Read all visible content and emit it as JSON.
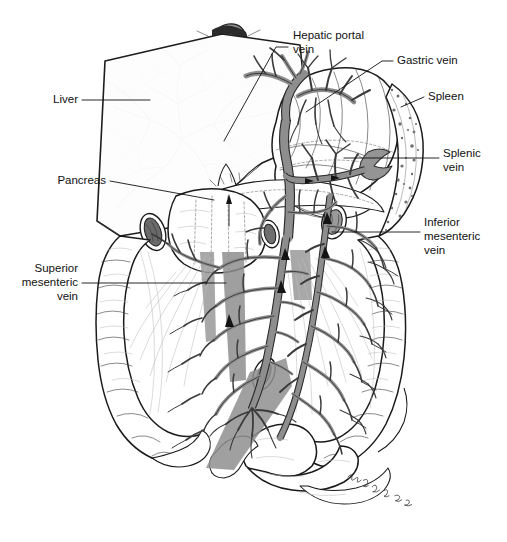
{
  "figure": {
    "kind": "anatomical-illustration",
    "background_color": "#ffffff",
    "line_color": "#111111",
    "vein_color": "#8e8e8e",
    "vein_outline_color": "#2e2e2e",
    "liver_vessel_color": "#bdbdbd",
    "spleen_stipple_color": "#6f6f6f",
    "label_font_size_px": 11.5
  },
  "labels": [
    {
      "id": "hepatic-portal-vein",
      "lines": [
        "Hepatic portal",
        "vein"
      ],
      "line1": "Hepatic portal",
      "line2": "vein",
      "text_x": 293,
      "text_y": 36,
      "align": "start",
      "leader": "M 288 47 L 276 47 L 224 141"
    },
    {
      "id": "gastric-vein",
      "lines": [
        "Gastric vein"
      ],
      "line1": "Gastric vein",
      "text_x": 397,
      "text_y": 61,
      "align": "start",
      "leader": "M 393 61 L 382 61 L 306 112"
    },
    {
      "id": "spleen",
      "lines": [
        "Spleen"
      ],
      "line1": "Spleen",
      "text_x": 428,
      "text_y": 97,
      "align": "start",
      "leader": "M 424 97 L 401 107"
    },
    {
      "id": "splenic-vein",
      "lines": [
        "Splenic",
        "vein"
      ],
      "line1": "Splenic",
      "line2": "vein",
      "text_x": 443,
      "text_y": 154,
      "align": "start",
      "leader": "M 439 158 L 344 158"
    },
    {
      "id": "inferior-mesenteric-vein",
      "lines": [
        "Inferior",
        "mesenteric",
        "vein"
      ],
      "line1": "Inferior",
      "line2": "mesenteric",
      "line3": "vein",
      "text_x": 424,
      "text_y": 223,
      "align": "start",
      "leader": "M 420 232 L 332 232"
    },
    {
      "id": "liver",
      "lines": [
        "Liver"
      ],
      "line1": "Liver",
      "text_x": 78,
      "text_y": 100,
      "align": "end",
      "leader": "M 82 100 L 150 100"
    },
    {
      "id": "pancreas",
      "lines": [
        "Pancreas"
      ],
      "line1": "Pancreas",
      "text_x": 106,
      "text_y": 181,
      "align": "end",
      "leader": "M 110 181 L 214 200"
    },
    {
      "id": "superior-mesenteric-vein",
      "lines": [
        "Superior",
        "mesenteric",
        "vein"
      ],
      "line1": "Superior",
      "line2": "mesenteric",
      "line3": "vein",
      "text_x": 78,
      "text_y": 283,
      "align": "end",
      "leader": "M 82 283 L 226 283"
    }
  ],
  "organs": [
    {
      "id": "esophagus",
      "name": "Esophagus stump"
    },
    {
      "id": "liver",
      "name": "Liver"
    },
    {
      "id": "stomach",
      "name": "Stomach"
    },
    {
      "id": "spleen",
      "name": "Spleen"
    },
    {
      "id": "pancreas",
      "name": "Pancreas"
    },
    {
      "id": "duodenum",
      "name": "Duodenum"
    },
    {
      "id": "ascending-colon",
      "name": "Ascending colon"
    },
    {
      "id": "descending-colon",
      "name": "Descending colon"
    },
    {
      "id": "small-intestine",
      "name": "Small intestine"
    },
    {
      "id": "sigmoid-colon",
      "name": "Sigmoid colon"
    }
  ],
  "vessels": [
    {
      "id": "hepatic-portal-vein",
      "name": "Hepatic portal vein"
    },
    {
      "id": "gastric-vein",
      "name": "Gastric vein"
    },
    {
      "id": "splenic-vein",
      "name": "Splenic vein"
    },
    {
      "id": "superior-mesenteric-vein",
      "name": "Superior mesenteric vein"
    },
    {
      "id": "inferior-mesenteric-vein",
      "name": "Inferior mesenteric vein"
    }
  ],
  "flow_arrows": {
    "count": 8,
    "color": "#141414",
    "meaning": "direction of venous blood flow toward the liver"
  },
  "signature": {
    "present": true,
    "text": "",
    "x": 355,
    "y": 487,
    "note": "cursive artist signature, illegible at this resolution"
  }
}
